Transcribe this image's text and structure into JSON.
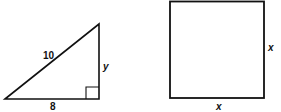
{
  "triangle": {
    "hypotenuse_label": "10",
    "vertical_leg_label": "y",
    "base_label": "8",
    "right_angle": true
  },
  "square": {
    "side_label_right": "x",
    "side_label_bottom": "x"
  },
  "colors": {
    "stroke": "#111111",
    "background": "#ffffff"
  }
}
